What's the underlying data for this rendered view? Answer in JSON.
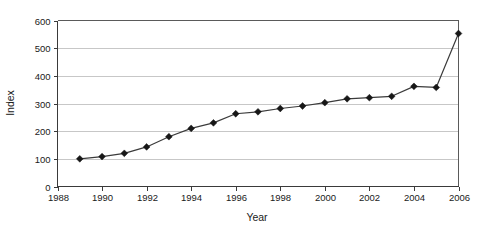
{
  "chart_data": {
    "type": "line",
    "title": "",
    "subtitle": "",
    "xlabel": "Year",
    "ylabel": "Index",
    "xlim": [
      1988,
      2006
    ],
    "ylim": [
      0,
      600
    ],
    "grid": "horizontal",
    "legend": "none",
    "marker": "diamond",
    "x_ticks": [
      "1988",
      "1990",
      "1992",
      "1994",
      "1996",
      "1998",
      "2000",
      "2002",
      "2004",
      "2006"
    ],
    "y_ticks": [
      "0",
      "100",
      "200",
      "300",
      "400",
      "500",
      "600"
    ],
    "x": [
      1989,
      1990,
      1991,
      1992,
      1993,
      1994,
      1995,
      1996,
      1997,
      1998,
      1999,
      2000,
      2001,
      2002,
      2003,
      2004,
      2005,
      2006
    ],
    "values": [
      100,
      108,
      120,
      143,
      180,
      210,
      230,
      263,
      270,
      282,
      291,
      303,
      317,
      321,
      326,
      362,
      358,
      553
    ],
    "series": [
      {
        "name": "Index",
        "color": "#3b3b3b",
        "values": [
          100,
          108,
          120,
          143,
          180,
          210,
          230,
          263,
          270,
          282,
          291,
          303,
          317,
          321,
          326,
          362,
          358,
          553
        ]
      }
    ],
    "colors": {
      "line": "#3b3b3b",
      "marker": "#171717",
      "gridline": "#b9b9b9",
      "frame": "#5a5a5a",
      "text": "#1a1a1a",
      "background": "#ffffff"
    }
  }
}
